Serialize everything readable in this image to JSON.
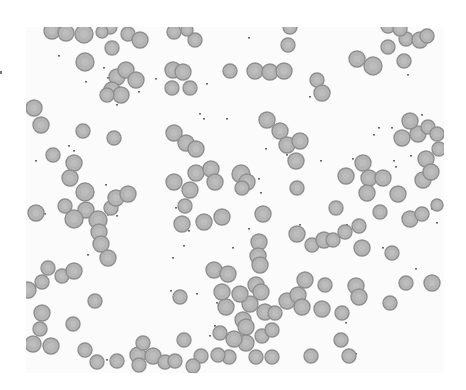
{
  "image": {
    "subject": "blood smear micrograph",
    "colors": {
      "background": "#fbfbfb",
      "cell_fill": "#b4b4b4",
      "cell_border": "#8e8e8e",
      "debris": "#6a6a6a"
    },
    "cells": [
      [
        52,
        31,
        8
      ],
      [
        66,
        33,
        8
      ],
      [
        84,
        34,
        9
      ],
      [
        110,
        27,
        7
      ],
      [
        128,
        34,
        7
      ],
      [
        140,
        40,
        8
      ],
      [
        112,
        48,
        7
      ],
      [
        102,
        32,
        6
      ],
      [
        85,
        62,
        9
      ],
      [
        117,
        77,
        8
      ],
      [
        126,
        70,
        8
      ],
      [
        112,
        90,
        8
      ],
      [
        121,
        95,
        8
      ],
      [
        107,
        95,
        7
      ],
      [
        136,
        80,
        8
      ],
      [
        174,
        32,
        7
      ],
      [
        195,
        40,
        7
      ],
      [
        187,
        30,
        6
      ],
      [
        173,
        70,
        8
      ],
      [
        183,
        72,
        8
      ],
      [
        172,
        88,
        7
      ],
      [
        190,
        88,
        7
      ],
      [
        34,
        108,
        8
      ],
      [
        41,
        125,
        8
      ],
      [
        83,
        131,
        7
      ],
      [
        114,
        138,
        7
      ],
      [
        74,
        163,
        8
      ],
      [
        70,
        178,
        8
      ],
      [
        65,
        206,
        7
      ],
      [
        85,
        192,
        9
      ],
      [
        86,
        210,
        8
      ],
      [
        74,
        219,
        9
      ],
      [
        98,
        220,
        9
      ],
      [
        99,
        232,
        8
      ],
      [
        101,
        244,
        8
      ],
      [
        111,
        208,
        7
      ],
      [
        116,
        198,
        8
      ],
      [
        128,
        194,
        8
      ],
      [
        108,
        258,
        8
      ],
      [
        36,
        213,
        8
      ],
      [
        53,
        155,
        7
      ],
      [
        174,
        133,
        8
      ],
      [
        186,
        143,
        8
      ],
      [
        196,
        149,
        8
      ],
      [
        174,
        182,
        8
      ],
      [
        196,
        173,
        8
      ],
      [
        190,
        190,
        8
      ],
      [
        211,
        169,
        8
      ],
      [
        215,
        182,
        8
      ],
      [
        185,
        206,
        7
      ],
      [
        204,
        222,
        8
      ],
      [
        222,
        217,
        8
      ],
      [
        182,
        224,
        8
      ],
      [
        241,
        174,
        9
      ],
      [
        247,
        182,
        8
      ],
      [
        242,
        188,
        7
      ],
      [
        230,
        71,
        7
      ],
      [
        255,
        71,
        8
      ],
      [
        270,
        72,
        8
      ],
      [
        284,
        71,
        8
      ],
      [
        290,
        27,
        7
      ],
      [
        288,
        45,
        7
      ],
      [
        317,
        80,
        7
      ],
      [
        322,
        93,
        8
      ],
      [
        267,
        120,
        8
      ],
      [
        280,
        131,
        8
      ],
      [
        287,
        145,
        8
      ],
      [
        300,
        141,
        8
      ],
      [
        296,
        161,
        8
      ],
      [
        297,
        188,
        7
      ],
      [
        263,
        214,
        8
      ],
      [
        336,
        208,
        7
      ],
      [
        346,
        176,
        8
      ],
      [
        363,
        163,
        8
      ],
      [
        369,
        178,
        8
      ],
      [
        383,
        178,
        8
      ],
      [
        367,
        193,
        8
      ],
      [
        398,
        194,
        8
      ],
      [
        410,
        219,
        8
      ],
      [
        380,
        212,
        7
      ],
      [
        357,
        59,
        8
      ],
      [
        373,
        66,
        9
      ],
      [
        388,
        47,
        7
      ],
      [
        404,
        61,
        7
      ],
      [
        406,
        39,
        7
      ],
      [
        420,
        40,
        8
      ],
      [
        427,
        36,
        7
      ],
      [
        388,
        26,
        7
      ],
      [
        400,
        29,
        7
      ],
      [
        418,
        134,
        8
      ],
      [
        402,
        138,
        8
      ],
      [
        410,
        121,
        8
      ],
      [
        428,
        127,
        7
      ],
      [
        437,
        134,
        7
      ],
      [
        426,
        159,
        8
      ],
      [
        423,
        180,
        8
      ],
      [
        431,
        172,
        8
      ],
      [
        437,
        205,
        6
      ],
      [
        439,
        149,
        7
      ],
      [
        422,
        214,
        7
      ],
      [
        259,
        242,
        8
      ],
      [
        297,
        234,
        8
      ],
      [
        312,
        245,
        7
      ],
      [
        324,
        240,
        8
      ],
      [
        333,
        240,
        7
      ],
      [
        345,
        232,
        7
      ],
      [
        359,
        226,
        7
      ],
      [
        362,
        248,
        8
      ],
      [
        392,
        253,
        7
      ],
      [
        406,
        283,
        7
      ],
      [
        432,
        283,
        8
      ],
      [
        356,
        286,
        8
      ],
      [
        359,
        297,
        8
      ],
      [
        390,
        303,
        7
      ],
      [
        258,
        256,
        8
      ],
      [
        260,
        265,
        8
      ],
      [
        256,
        285,
        8
      ],
      [
        261,
        292,
        8
      ],
      [
        250,
        304,
        8
      ],
      [
        265,
        312,
        8
      ],
      [
        287,
        301,
        8
      ],
      [
        298,
        295,
        8
      ],
      [
        305,
        280,
        8
      ],
      [
        325,
        285,
        7
      ],
      [
        322,
        309,
        8
      ],
      [
        342,
        313,
        7
      ],
      [
        341,
        340,
        7
      ],
      [
        302,
        307,
        8
      ],
      [
        214,
        270,
        8
      ],
      [
        228,
        274,
        8
      ],
      [
        222,
        292,
        8
      ],
      [
        240,
        294,
        8
      ],
      [
        243,
        320,
        8
      ],
      [
        246,
        327,
        8
      ],
      [
        246,
        343,
        8
      ],
      [
        234,
        339,
        8
      ],
      [
        220,
        333,
        7
      ],
      [
        226,
        307,
        8
      ],
      [
        275,
        313,
        7
      ],
      [
        262,
        336,
        7
      ],
      [
        272,
        330,
        7
      ],
      [
        256,
        357,
        7
      ],
      [
        229,
        357,
        7
      ],
      [
        218,
        355,
        7
      ],
      [
        272,
        357,
        7
      ],
      [
        48,
        268,
        7
      ],
      [
        62,
        276,
        7
      ],
      [
        74,
        271,
        8
      ],
      [
        42,
        282,
        7
      ],
      [
        28,
        290,
        8
      ],
      [
        42,
        313,
        8
      ],
      [
        40,
        329,
        7
      ],
      [
        33,
        344,
        8
      ],
      [
        51,
        346,
        8
      ],
      [
        73,
        324,
        7
      ],
      [
        95,
        301,
        7
      ],
      [
        85,
        350,
        7
      ],
      [
        97,
        362,
        7
      ],
      [
        138,
        355,
        8
      ],
      [
        143,
        343,
        7
      ],
      [
        153,
        356,
        8
      ],
      [
        165,
        362,
        7
      ],
      [
        117,
        361,
        7
      ],
      [
        139,
        365,
        7
      ],
      [
        180,
        297,
        7
      ],
      [
        184,
        340,
        7
      ],
      [
        175,
        361,
        7
      ],
      [
        201,
        356,
        7
      ],
      [
        193,
        366,
        7
      ],
      [
        311,
        356,
        7
      ],
      [
        349,
        356,
        7
      ]
    ],
    "debris": [
      [
        58,
        55
      ],
      [
        103,
        67
      ],
      [
        121,
        70
      ],
      [
        85,
        81
      ],
      [
        107,
        77
      ],
      [
        138,
        91
      ],
      [
        116,
        104
      ],
      [
        143,
        42
      ],
      [
        155,
        78
      ],
      [
        198,
        39
      ],
      [
        248,
        37
      ],
      [
        206,
        83
      ],
      [
        199,
        113
      ],
      [
        203,
        118
      ],
      [
        226,
        118
      ],
      [
        265,
        148
      ],
      [
        258,
        178
      ],
      [
        286,
        154
      ],
      [
        309,
        96
      ],
      [
        320,
        160
      ],
      [
        352,
        158
      ],
      [
        361,
        160
      ],
      [
        373,
        134
      ],
      [
        378,
        127
      ],
      [
        391,
        127
      ],
      [
        395,
        166
      ],
      [
        410,
        155
      ],
      [
        421,
        114
      ],
      [
        407,
        74
      ],
      [
        393,
        160
      ],
      [
        68,
        145
      ],
      [
        73,
        150
      ],
      [
        35,
        160
      ],
      [
        44,
        213
      ],
      [
        80,
        212
      ],
      [
        105,
        184
      ],
      [
        116,
        215
      ],
      [
        107,
        214
      ],
      [
        87,
        254
      ],
      [
        104,
        98
      ],
      [
        175,
        207
      ],
      [
        188,
        230
      ],
      [
        232,
        247
      ],
      [
        248,
        228
      ],
      [
        260,
        192
      ],
      [
        299,
        224
      ],
      [
        340,
        226
      ],
      [
        346,
        224
      ],
      [
        358,
        246
      ],
      [
        382,
        247
      ],
      [
        390,
        256
      ],
      [
        431,
        208
      ],
      [
        436,
        222
      ],
      [
        172,
        257
      ],
      [
        183,
        245
      ],
      [
        170,
        290
      ],
      [
        216,
        302
      ],
      [
        196,
        293
      ],
      [
        214,
        325
      ],
      [
        209,
        335
      ],
      [
        223,
        330
      ],
      [
        178,
        357
      ],
      [
        150,
        356
      ],
      [
        106,
        359
      ],
      [
        345,
        322
      ],
      [
        355,
        353
      ],
      [
        391,
        298
      ],
      [
        415,
        268
      ]
    ]
  }
}
